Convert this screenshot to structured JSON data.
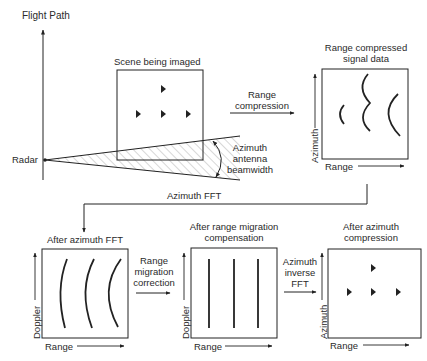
{
  "colors": {
    "line": "#222222",
    "hatch": "#9a9a9a",
    "background": "#ffffff"
  },
  "top": {
    "flight_path_label": "Flight Path",
    "radar_label": "Radar",
    "scene_title": "Scene being imaged",
    "beam_label_line1": "Azimuth",
    "beam_label_line2": "antenna",
    "beam_label_line3": "beamwidth",
    "range_compression_line1": "Range",
    "range_compression_line2": "compression",
    "range_compressed_title_line1": "Range compressed",
    "range_compressed_title_line2": "signal data",
    "range_compressed_xaxis": "Range",
    "range_compressed_yaxis": "Azimuth"
  },
  "connector": {
    "label": "Azimuth FFT"
  },
  "bottom": {
    "panels": [
      {
        "title_line1": "After azimuth FFT",
        "title_line2": "",
        "xaxis": "Range",
        "yaxis": "Doppler"
      },
      {
        "title_line1": "After range migration",
        "title_line2": "compensation",
        "xaxis": "Range",
        "yaxis": "Doppler"
      },
      {
        "title_line1": "After azimuth",
        "title_line2": "compression",
        "xaxis": "Range",
        "yaxis": "Azimuth"
      }
    ],
    "step1_line1": "Range",
    "step1_line2": "migration",
    "step1_line3": "correction",
    "step2_line1": "Azimuth",
    "step2_line2": "inverse",
    "step2_line3": "FFT"
  }
}
